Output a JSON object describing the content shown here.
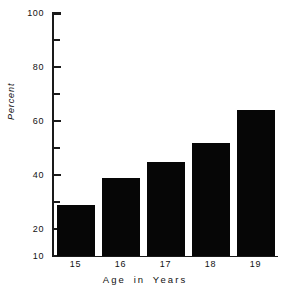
{
  "chart_data": {
    "type": "bar",
    "title": "",
    "xlabel": "Age in Years",
    "ylabel": "Percent",
    "categories": [
      "15",
      "16",
      "17",
      "18",
      "19"
    ],
    "values": [
      29,
      39,
      45,
      52,
      64
    ],
    "ylim": [
      10,
      100
    ],
    "ytick_major": [
      10,
      20,
      40,
      60,
      80,
      100
    ],
    "ytick_minor": [
      30,
      50,
      70,
      90
    ],
    "ytick_labels": [
      "10",
      "20",
      "40",
      "60",
      "80",
      "100"
    ],
    "grid": false,
    "legend": false,
    "bar_color": "#060606",
    "axis_color": "#1a1a1a",
    "background": "#ffffff"
  },
  "axis": {
    "y_labels": [
      {
        "text": "100",
        "value": 100
      },
      {
        "text": "80",
        "value": 80
      },
      {
        "text": "60",
        "value": 60
      },
      {
        "text": "40",
        "value": 40
      },
      {
        "text": "20",
        "value": 20
      },
      {
        "text": "10",
        "value": 10
      }
    ],
    "y_ticks": [
      100,
      90,
      80,
      70,
      60,
      50,
      40,
      30,
      20,
      10
    ],
    "y_major_ticks": [
      100,
      80,
      60,
      40,
      20,
      10
    ]
  },
  "labels": {
    "x_axis_title": "Age in Years",
    "y_axis_title": "Percent"
  }
}
